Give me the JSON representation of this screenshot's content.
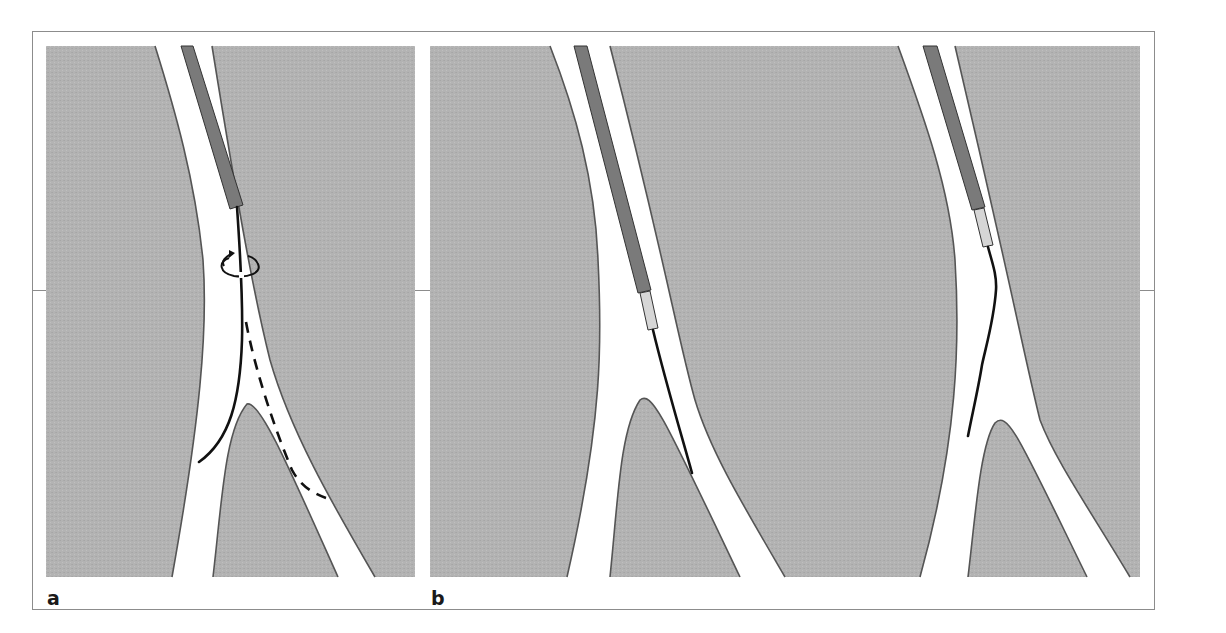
{
  "figure": {
    "panels": [
      {
        "label": "a",
        "description": "Guidewire rotated at vessel bifurcation; solid wire curving into left branch, dashed alternative path into right branch",
        "elements": [
          "vessel-wall",
          "catheter",
          "guidewire-solid",
          "guidewire-dashed",
          "rotation-arrow"
        ]
      },
      {
        "label": "b",
        "description": "Two sub-panels: catheter with inner sleeve advancing wire into right branch; catheter with sleeve and angled wire tip directed toward left branch",
        "elements": [
          "vessel-wall",
          "catheter",
          "inner-sleeve",
          "guidewire"
        ]
      }
    ]
  },
  "colors": {
    "tissue": "#b3b3b3",
    "vessel_lumen": "#ffffff",
    "vessel_wall": "#555555",
    "catheter": "#7a7a7a",
    "sleeve": "#d6d6d6",
    "guidewire": "#111111",
    "frame": "#8c8c8c"
  }
}
